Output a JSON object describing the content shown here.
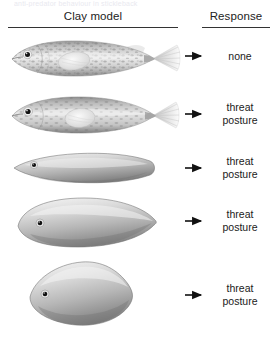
{
  "figure": {
    "cut_off_caption": "anti-predator behaviour in stickleback",
    "columns": {
      "model_header": "Clay model",
      "response_header": "Response"
    },
    "arrow_icon": "right-arrow-icon",
    "rows": [
      {
        "model_name": "realistic-stickleback-model",
        "model_description": "Realistic mottled stickleback with eye, pectoral fin, dorsal and anal fins and fanned caudal fin",
        "response_lines": [
          "none"
        ]
      },
      {
        "model_name": "stickleback-model-no-spines",
        "model_description": "Realistic stickleback body with eye, pectoral fin and fanned caudal fin, smoother back",
        "response_lines": [
          "threat",
          "posture"
        ]
      },
      {
        "model_name": "elongated-lens-model",
        "model_description": "Smooth elongated lens-shaped grey body with eye, no fins",
        "response_lines": [
          "threat",
          "posture"
        ]
      },
      {
        "model_name": "broad-oval-model",
        "model_description": "Broad rounded oval-pointed grey body with eye, no fins",
        "response_lines": [
          "threat",
          "posture"
        ]
      },
      {
        "model_name": "rounded-diamond-model",
        "model_description": "Rounded diamond shaped grey body with eye, no fins",
        "response_lines": [
          "threat",
          "posture"
        ]
      }
    ],
    "colors": {
      "rule": "#333333",
      "text": "#1a1a1a",
      "arrow": "#111111",
      "body_light": "#e8e8e8",
      "body_mid": "#b4b4b4",
      "body_dark": "#6f6f6f",
      "eye": "#111111",
      "background": "#ffffff"
    }
  }
}
